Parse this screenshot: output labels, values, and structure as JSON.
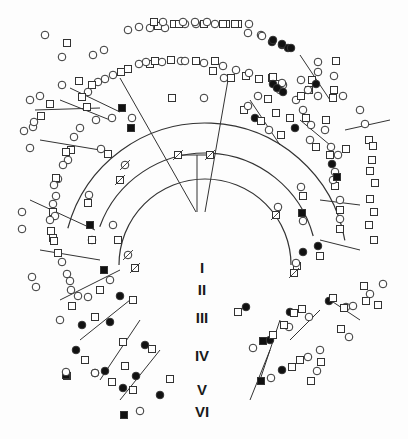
{
  "figure": {
    "type": "circular-pedigree",
    "line_color": "#333333",
    "affected_fill": "#111111",
    "unaffected_fill": "#ffffff"
  },
  "generations": [
    {
      "label": "I",
      "x": 202,
      "y": 268
    },
    {
      "label": "II",
      "x": 202,
      "y": 290
    },
    {
      "label": "III",
      "x": 202,
      "y": 318
    },
    {
      "label": "IV",
      "x": 202,
      "y": 356
    },
    {
      "label": "V",
      "x": 202,
      "y": 390
    },
    {
      "label": "VI",
      "x": 202,
      "y": 412
    }
  ],
  "legend": {
    "male": "square",
    "female": "circle",
    "affected": "filled",
    "deceased": "slash"
  },
  "arcs": [
    {
      "cx": 205,
      "cy": 265,
      "r": 112,
      "start": 200,
      "end": 345
    },
    {
      "cx": 205,
      "cy": 265,
      "r": 142,
      "start": 195,
      "end": 350
    },
    {
      "cx": 205,
      "cy": 265,
      "r": 86,
      "start": 180,
      "end": 360
    }
  ],
  "lines": [
    [
      197,
      155,
      197,
      212
    ],
    [
      178,
      155,
      210,
      155
    ],
    [
      120,
      78,
      196,
      212
    ],
    [
      228,
      80,
      205,
      212
    ],
    [
      60,
      100,
      110,
      120
    ],
    [
      250,
      100,
      280,
      145
    ],
    [
      40,
      140,
      100,
      150
    ],
    [
      300,
      120,
      330,
      145
    ],
    [
      30,
      200,
      95,
      230
    ],
    [
      320,
      200,
      360,
      205
    ],
    [
      40,
      250,
      100,
      260
    ],
    [
      320,
      240,
      360,
      250
    ],
    [
      60,
      300,
      120,
      270
    ],
    [
      330,
      300,
      360,
      320
    ],
    [
      80,
      340,
      130,
      300
    ],
    [
      290,
      340,
      320,
      310
    ],
    [
      100,
      380,
      140,
      320
    ],
    [
      260,
      380,
      280,
      320
    ],
    [
      120,
      400,
      160,
      350
    ],
    [
      250,
      400,
      270,
      350
    ],
    [
      35,
      110,
      100,
      108
    ],
    [
      345,
      130,
      390,
      120
    ],
    [
      70,
      88,
      120,
      112
    ],
    [
      300,
      55,
      330,
      100
    ]
  ],
  "nodes": [
    {
      "x": 178,
      "y": 155,
      "s": "m",
      "d": 1
    },
    {
      "x": 210,
      "y": 155,
      "s": "m",
      "d": 1
    },
    {
      "x": 172,
      "y": 98,
      "s": "m"
    },
    {
      "x": 204,
      "y": 98,
      "s": "f"
    },
    {
      "x": 112,
      "y": 118,
      "s": "f"
    },
    {
      "x": 122,
      "y": 108,
      "s": "m",
      "a": 1
    },
    {
      "x": 96,
      "y": 120,
      "s": "f"
    },
    {
      "x": 87,
      "y": 107,
      "s": "m"
    },
    {
      "x": 258,
      "y": 96,
      "s": "f"
    },
    {
      "x": 268,
      "y": 99,
      "s": "m"
    },
    {
      "x": 131,
      "y": 128,
      "s": "m",
      "a": 1
    },
    {
      "x": 132,
      "y": 118,
      "s": "f"
    },
    {
      "x": 125,
      "y": 165,
      "s": "f",
      "d": 1
    },
    {
      "x": 120,
      "y": 180,
      "s": "m",
      "d": 1
    },
    {
      "x": 90,
      "y": 225,
      "s": "m",
      "a": 1
    },
    {
      "x": 92,
      "y": 240,
      "s": "f"
    },
    {
      "x": 113,
      "y": 225,
      "s": "f"
    },
    {
      "x": 118,
      "y": 240,
      "s": "m"
    },
    {
      "x": 128,
      "y": 255,
      "s": "f",
      "d": 1
    },
    {
      "x": 135,
      "y": 268,
      "s": "m",
      "d": 1
    },
    {
      "x": 104,
      "y": 270,
      "s": "m",
      "a": 1
    },
    {
      "x": 110,
      "y": 280,
      "s": "f"
    },
    {
      "x": 120,
      "y": 296,
      "s": "f",
      "a": 1
    },
    {
      "x": 133,
      "y": 300,
      "s": "m"
    },
    {
      "x": 100,
      "y": 290,
      "s": "m"
    },
    {
      "x": 88,
      "y": 297,
      "s": "f"
    },
    {
      "x": 60,
      "y": 320,
      "s": "f"
    },
    {
      "x": 72,
      "y": 306,
      "s": "m"
    },
    {
      "x": 82,
      "y": 325,
      "s": "f",
      "a": 1
    },
    {
      "x": 95,
      "y": 317,
      "s": "m"
    },
    {
      "x": 110,
      "y": 322,
      "s": "f",
      "a": 1
    },
    {
      "x": 123,
      "y": 342,
      "s": "m"
    },
    {
      "x": 76,
      "y": 350,
      "s": "f",
      "a": 1
    },
    {
      "x": 85,
      "y": 360,
      "s": "m"
    },
    {
      "x": 105,
      "y": 371,
      "s": "f",
      "a": 1
    },
    {
      "x": 112,
      "y": 382,
      "s": "m"
    },
    {
      "x": 95,
      "y": 373,
      "s": "f",
      "a": 1
    },
    {
      "x": 67,
      "y": 376,
      "s": "m"
    },
    {
      "x": 66,
      "y": 375,
      "s": "m",
      "a": 1
    },
    {
      "x": 95,
      "y": 373,
      "s": "f"
    },
    {
      "x": 136,
      "y": 376,
      "s": "f",
      "a": 1
    },
    {
      "x": 125,
      "y": 366,
      "s": "m"
    },
    {
      "x": 123,
      "y": 388,
      "s": "f",
      "a": 1
    },
    {
      "x": 133,
      "y": 390,
      "s": "m"
    },
    {
      "x": 145,
      "y": 345,
      "s": "f",
      "a": 1
    },
    {
      "x": 152,
      "y": 349,
      "s": "m"
    },
    {
      "x": 124,
      "y": 415,
      "s": "m",
      "a": 1
    },
    {
      "x": 140,
      "y": 411,
      "s": "f"
    },
    {
      "x": 160,
      "y": 395,
      "s": "f",
      "a": 1
    },
    {
      "x": 170,
      "y": 379,
      "s": "m"
    },
    {
      "x": 66,
      "y": 372,
      "s": "f"
    },
    {
      "x": 246,
      "y": 307,
      "s": "f",
      "a": 1
    },
    {
      "x": 238,
      "y": 312,
      "s": "m"
    },
    {
      "x": 263,
      "y": 341,
      "s": "m",
      "a": 1
    },
    {
      "x": 253,
      "y": 348,
      "s": "f"
    },
    {
      "x": 270,
      "y": 340,
      "s": "f",
      "a": 1
    },
    {
      "x": 273,
      "y": 335,
      "s": "m"
    },
    {
      "x": 261,
      "y": 381,
      "s": "m",
      "a": 1
    },
    {
      "x": 271,
      "y": 378,
      "s": "f"
    },
    {
      "x": 282,
      "y": 370,
      "s": "f",
      "a": 1
    },
    {
      "x": 292,
      "y": 367,
      "s": "m"
    },
    {
      "x": 290,
      "y": 312,
      "s": "f",
      "a": 1
    },
    {
      "x": 302,
      "y": 309,
      "s": "m"
    },
    {
      "x": 289,
      "y": 327,
      "s": "f"
    },
    {
      "x": 284,
      "y": 325,
      "s": "m"
    },
    {
      "x": 294,
      "y": 313,
      "s": "m"
    },
    {
      "x": 309,
      "y": 317,
      "s": "f"
    },
    {
      "x": 320,
      "y": 350,
      "s": "f"
    },
    {
      "x": 321,
      "y": 362,
      "s": "m"
    },
    {
      "x": 341,
      "y": 329,
      "s": "m"
    },
    {
      "x": 349,
      "y": 337,
      "s": "f"
    },
    {
      "x": 300,
      "y": 360,
      "s": "m"
    },
    {
      "x": 308,
      "y": 357,
      "s": "f"
    },
    {
      "x": 317,
      "y": 371,
      "s": "f"
    },
    {
      "x": 311,
      "y": 381,
      "s": "m"
    },
    {
      "x": 346,
      "y": 307,
      "s": "f"
    },
    {
      "x": 344,
      "y": 308,
      "s": "m"
    },
    {
      "x": 353,
      "y": 306,
      "s": "f"
    },
    {
      "x": 366,
      "y": 301,
      "s": "m"
    },
    {
      "x": 364,
      "y": 286,
      "s": "m"
    },
    {
      "x": 383,
      "y": 284,
      "s": "f"
    },
    {
      "x": 370,
      "y": 294,
      "s": "f"
    },
    {
      "x": 378,
      "y": 305,
      "s": "m"
    },
    {
      "x": 318,
      "y": 246,
      "s": "f",
      "a": 1
    },
    {
      "x": 320,
      "y": 256,
      "s": "m"
    },
    {
      "x": 303,
      "y": 252,
      "s": "f",
      "a": 1
    },
    {
      "x": 297,
      "y": 266,
      "s": "m"
    },
    {
      "x": 329,
      "y": 301,
      "s": "f",
      "a": 1
    },
    {
      "x": 333,
      "y": 298,
      "s": "m"
    },
    {
      "x": 294,
      "y": 273,
      "s": "m",
      "d": 1
    },
    {
      "x": 296,
      "y": 263,
      "s": "f"
    },
    {
      "x": 302,
      "y": 213,
      "s": "m",
      "a": 1
    },
    {
      "x": 303,
      "y": 221,
      "s": "f"
    },
    {
      "x": 276,
      "y": 215,
      "s": "m",
      "d": 1
    },
    {
      "x": 278,
      "y": 207,
      "s": "f"
    },
    {
      "x": 340,
      "y": 219,
      "s": "f"
    },
    {
      "x": 340,
      "y": 229,
      "s": "m"
    },
    {
      "x": 369,
      "y": 225,
      "s": "m"
    },
    {
      "x": 374,
      "y": 240,
      "s": "m"
    },
    {
      "x": 340,
      "y": 200,
      "s": "f"
    },
    {
      "x": 340,
      "y": 210,
      "s": "m"
    },
    {
      "x": 370,
      "y": 199,
      "s": "m"
    },
    {
      "x": 374,
      "y": 212,
      "s": "m"
    },
    {
      "x": 335,
      "y": 186,
      "s": "m"
    },
    {
      "x": 333,
      "y": 180,
      "s": "f"
    },
    {
      "x": 375,
      "y": 183,
      "s": "m"
    },
    {
      "x": 332,
      "y": 164,
      "s": "f",
      "a": 1
    },
    {
      "x": 335,
      "y": 172,
      "s": "f"
    },
    {
      "x": 337,
      "y": 177,
      "s": "m",
      "a": 1
    },
    {
      "x": 372,
      "y": 160,
      "s": "m"
    },
    {
      "x": 370,
      "y": 171,
      "s": "m"
    },
    {
      "x": 301,
      "y": 187,
      "s": "f"
    },
    {
      "x": 303,
      "y": 196,
      "s": "m"
    },
    {
      "x": 338,
      "y": 155,
      "s": "f"
    },
    {
      "x": 346,
      "y": 149,
      "s": "m"
    },
    {
      "x": 330,
      "y": 155,
      "s": "m"
    },
    {
      "x": 331,
      "y": 147,
      "s": "f"
    },
    {
      "x": 369,
      "y": 140,
      "s": "m"
    },
    {
      "x": 373,
      "y": 146,
      "s": "m"
    },
    {
      "x": 310,
      "y": 140,
      "s": "f"
    },
    {
      "x": 316,
      "y": 147,
      "s": "m"
    },
    {
      "x": 325,
      "y": 130,
      "s": "f"
    },
    {
      "x": 326,
      "y": 120,
      "s": "m"
    },
    {
      "x": 360,
      "y": 110,
      "s": "f"
    },
    {
      "x": 365,
      "y": 124,
      "s": "f"
    },
    {
      "x": 290,
      "y": 118,
      "s": "m"
    },
    {
      "x": 303,
      "y": 110,
      "s": "f"
    },
    {
      "x": 318,
      "y": 96,
      "s": "f"
    },
    {
      "x": 334,
      "y": 90,
      "s": "m"
    },
    {
      "x": 343,
      "y": 96,
      "s": "f"
    },
    {
      "x": 333,
      "y": 98,
      "s": "m"
    },
    {
      "x": 269,
      "y": 130,
      "s": "f"
    },
    {
      "x": 276,
      "y": 113,
      "s": "m"
    },
    {
      "x": 296,
      "y": 100,
      "s": "f"
    },
    {
      "x": 301,
      "y": 96,
      "s": "m"
    },
    {
      "x": 318,
      "y": 72,
      "s": "f"
    },
    {
      "x": 334,
      "y": 76,
      "s": "f"
    },
    {
      "x": 318,
      "y": 62,
      "s": "f"
    },
    {
      "x": 336,
      "y": 61,
      "s": "m"
    },
    {
      "x": 306,
      "y": 118,
      "s": "m"
    },
    {
      "x": 311,
      "y": 125,
      "s": "f"
    },
    {
      "x": 281,
      "y": 135,
      "s": "m"
    },
    {
      "x": 295,
      "y": 128,
      "s": "f",
      "a": 1
    },
    {
      "x": 283,
      "y": 85,
      "s": "f"
    },
    {
      "x": 259,
      "y": 79,
      "s": "m"
    },
    {
      "x": 272,
      "y": 78,
      "s": "m"
    },
    {
      "x": 280,
      "y": 90,
      "s": "f"
    },
    {
      "x": 301,
      "y": 80,
      "s": "f"
    },
    {
      "x": 312,
      "y": 80,
      "s": "m"
    },
    {
      "x": 316,
      "y": 84,
      "s": "f",
      "a": 1
    },
    {
      "x": 278,
      "y": 84,
      "s": "m"
    },
    {
      "x": 273,
      "y": 77,
      "s": "m"
    },
    {
      "x": 282,
      "y": 83,
      "s": "f"
    },
    {
      "x": 309,
      "y": 90,
      "s": "m"
    },
    {
      "x": 308,
      "y": 90,
      "s": "f"
    },
    {
      "x": 272,
      "y": 42,
      "s": "f",
      "a": 1
    },
    {
      "x": 282,
      "y": 45,
      "s": "f",
      "a": 1
    },
    {
      "x": 288,
      "y": 48,
      "s": "f",
      "a": 1
    },
    {
      "x": 273,
      "y": 84,
      "s": "f",
      "a": 1
    },
    {
      "x": 277,
      "y": 88,
      "s": "f",
      "a": 1
    },
    {
      "x": 283,
      "y": 92,
      "s": "f",
      "a": 1
    },
    {
      "x": 255,
      "y": 118,
      "s": "f",
      "a": 1
    },
    {
      "x": 261,
      "y": 121,
      "s": "m"
    },
    {
      "x": 244,
      "y": 110,
      "s": "m"
    },
    {
      "x": 248,
      "y": 106,
      "s": "f"
    },
    {
      "x": 224,
      "y": 78,
      "s": "f"
    },
    {
      "x": 231,
      "y": 78,
      "s": "m"
    },
    {
      "x": 261,
      "y": 35,
      "s": "f"
    },
    {
      "x": 246,
      "y": 76,
      "s": "m"
    },
    {
      "x": 236,
      "y": 70,
      "s": "f"
    },
    {
      "x": 249,
      "y": 73,
      "s": "f"
    },
    {
      "x": 213,
      "y": 71,
      "s": "m"
    },
    {
      "x": 223,
      "y": 66,
      "s": "f"
    },
    {
      "x": 196,
      "y": 61,
      "s": "m"
    },
    {
      "x": 204,
      "y": 63,
      "s": "f"
    },
    {
      "x": 215,
      "y": 61,
      "s": "m"
    },
    {
      "x": 181,
      "y": 61,
      "s": "f"
    },
    {
      "x": 162,
      "y": 62,
      "s": "f"
    },
    {
      "x": 150,
      "y": 64,
      "s": "m"
    },
    {
      "x": 171,
      "y": 60,
      "s": "m"
    },
    {
      "x": 185,
      "y": 61,
      "s": "f"
    },
    {
      "x": 139,
      "y": 64,
      "s": "f"
    },
    {
      "x": 128,
      "y": 69,
      "s": "m"
    },
    {
      "x": 155,
      "y": 61,
      "s": "m"
    },
    {
      "x": 146,
      "y": 62,
      "s": "f"
    },
    {
      "x": 121,
      "y": 72,
      "s": "m"
    },
    {
      "x": 113,
      "y": 75,
      "s": "f"
    },
    {
      "x": 105,
      "y": 79,
      "s": "f"
    },
    {
      "x": 98,
      "y": 82,
      "s": "f"
    },
    {
      "x": 92,
      "y": 85,
      "s": "m"
    },
    {
      "x": 88,
      "y": 92,
      "s": "f"
    },
    {
      "x": 82,
      "y": 97,
      "s": "m"
    },
    {
      "x": 174,
      "y": 24,
      "s": "m"
    },
    {
      "x": 185,
      "y": 24,
      "s": "f"
    },
    {
      "x": 196,
      "y": 24,
      "s": "f"
    },
    {
      "x": 204,
      "y": 24,
      "s": "m"
    },
    {
      "x": 215,
      "y": 24,
      "s": "f"
    },
    {
      "x": 226,
      "y": 24,
      "s": "m"
    },
    {
      "x": 238,
      "y": 24,
      "s": "m"
    },
    {
      "x": 249,
      "y": 24,
      "s": "f"
    },
    {
      "x": 158,
      "y": 26,
      "s": "m"
    },
    {
      "x": 150,
      "y": 28,
      "s": "f"
    },
    {
      "x": 165,
      "y": 28,
      "s": "f"
    },
    {
      "x": 179,
      "y": 24,
      "s": "m"
    },
    {
      "x": 139,
      "y": 27,
      "s": "f"
    },
    {
      "x": 128,
      "y": 30,
      "s": "f"
    },
    {
      "x": 154,
      "y": 22,
      "s": "m"
    },
    {
      "x": 163,
      "y": 22,
      "s": "f"
    },
    {
      "x": 183,
      "y": 22,
      "s": "f"
    },
    {
      "x": 195,
      "y": 22,
      "s": "f"
    },
    {
      "x": 207,
      "y": 22,
      "s": "f"
    },
    {
      "x": 223,
      "y": 24,
      "s": "m"
    },
    {
      "x": 235,
      "y": 24,
      "s": "m"
    },
    {
      "x": 248,
      "y": 33,
      "s": "f"
    },
    {
      "x": 262,
      "y": 36,
      "s": "f"
    },
    {
      "x": 273,
      "y": 40,
      "s": "f",
      "a": 1
    },
    {
      "x": 282,
      "y": 44,
      "s": "f",
      "a": 1
    },
    {
      "x": 291,
      "y": 48,
      "s": "f",
      "a": 1
    },
    {
      "x": 93,
      "y": 55,
      "s": "f"
    },
    {
      "x": 104,
      "y": 50,
      "s": "f"
    },
    {
      "x": 67,
      "y": 43,
      "s": "m"
    },
    {
      "x": 45,
      "y": 35,
      "s": "f"
    },
    {
      "x": 62,
      "y": 57,
      "s": "f"
    },
    {
      "x": 40,
      "y": 96,
      "s": "f"
    },
    {
      "x": 50,
      "y": 104,
      "s": "m"
    },
    {
      "x": 30,
      "y": 100,
      "s": "f"
    },
    {
      "x": 33,
      "y": 127,
      "s": "f"
    },
    {
      "x": 41,
      "y": 116,
      "s": "m"
    },
    {
      "x": 34,
      "y": 122,
      "s": "f"
    },
    {
      "x": 24,
      "y": 131,
      "s": "f"
    },
    {
      "x": 62,
      "y": 85,
      "s": "f"
    },
    {
      "x": 79,
      "y": 81,
      "s": "m"
    },
    {
      "x": 30,
      "y": 148,
      "s": "f"
    },
    {
      "x": 80,
      "y": 128,
      "s": "f"
    },
    {
      "x": 74,
      "y": 137,
      "s": "f"
    },
    {
      "x": 71,
      "y": 150,
      "s": "m"
    },
    {
      "x": 66,
      "y": 152,
      "s": "m"
    },
    {
      "x": 68,
      "y": 160,
      "s": "f"
    },
    {
      "x": 63,
      "y": 165,
      "s": "f"
    },
    {
      "x": 58,
      "y": 179,
      "s": "f"
    },
    {
      "x": 101,
      "y": 149,
      "s": "f"
    },
    {
      "x": 108,
      "y": 154,
      "s": "m"
    },
    {
      "x": 56,
      "y": 178,
      "s": "m"
    },
    {
      "x": 54,
      "y": 185,
      "s": "f"
    },
    {
      "x": 56,
      "y": 196,
      "s": "f"
    },
    {
      "x": 53,
      "y": 204,
      "s": "f"
    },
    {
      "x": 53,
      "y": 212,
      "s": "m"
    },
    {
      "x": 55,
      "y": 216,
      "s": "f"
    },
    {
      "x": 89,
      "y": 195,
      "s": "f"
    },
    {
      "x": 88,
      "y": 203,
      "s": "m"
    },
    {
      "x": 22,
      "y": 212,
      "s": "f"
    },
    {
      "x": 22,
      "y": 229,
      "s": "f"
    },
    {
      "x": 50,
      "y": 220,
      "s": "f"
    },
    {
      "x": 51,
      "y": 231,
      "s": "m"
    },
    {
      "x": 53,
      "y": 238,
      "s": "m"
    },
    {
      "x": 54,
      "y": 241,
      "s": "m"
    },
    {
      "x": 58,
      "y": 253,
      "s": "m"
    },
    {
      "x": 92,
      "y": 240,
      "s": "m"
    },
    {
      "x": 32,
      "y": 277,
      "s": "f"
    },
    {
      "x": 36,
      "y": 287,
      "s": "f"
    },
    {
      "x": 62,
      "y": 262,
      "s": "f"
    },
    {
      "x": 67,
      "y": 274,
      "s": "f"
    },
    {
      "x": 70,
      "y": 281,
      "s": "f"
    },
    {
      "x": 71,
      "y": 290,
      "s": "f"
    },
    {
      "x": 78,
      "y": 296,
      "s": "f"
    }
  ]
}
